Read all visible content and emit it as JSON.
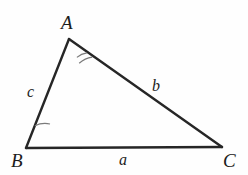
{
  "figure": {
    "kind": "triangle-diagram",
    "background_color": "#fefefe",
    "stroke_color": "#262626",
    "arc_color": "#6b6b6b",
    "label_color": "#1c1c1c"
  },
  "vertices": [
    {
      "id": "A",
      "label": "A",
      "x": 69,
      "y": 39,
      "label_x": 61,
      "label_y": 13
    },
    {
      "id": "B",
      "label": "B",
      "x": 26,
      "y": 148,
      "label_x": 11,
      "label_y": 151
    },
    {
      "id": "C",
      "label": "C",
      "x": 222,
      "y": 147,
      "label_x": 223,
      "label_y": 151
    }
  ],
  "sides": [
    {
      "id": "a",
      "label": "a",
      "between": "B-C",
      "label_x": 119,
      "label_y": 152
    },
    {
      "id": "b",
      "label": "b",
      "between": "A-C",
      "label_x": 152,
      "label_y": 78
    },
    {
      "id": "c",
      "label": "c",
      "between": "A-B",
      "label_x": 27,
      "label_y": 84
    }
  ],
  "angle_marks": [
    {
      "vertex": "A",
      "arcs": 2,
      "radii": [
        20,
        26
      ]
    },
    {
      "vertex": "B",
      "arcs": 1,
      "radii": [
        24
      ]
    },
    {
      "vertex": "C",
      "arcs": 0,
      "radii": []
    }
  ]
}
